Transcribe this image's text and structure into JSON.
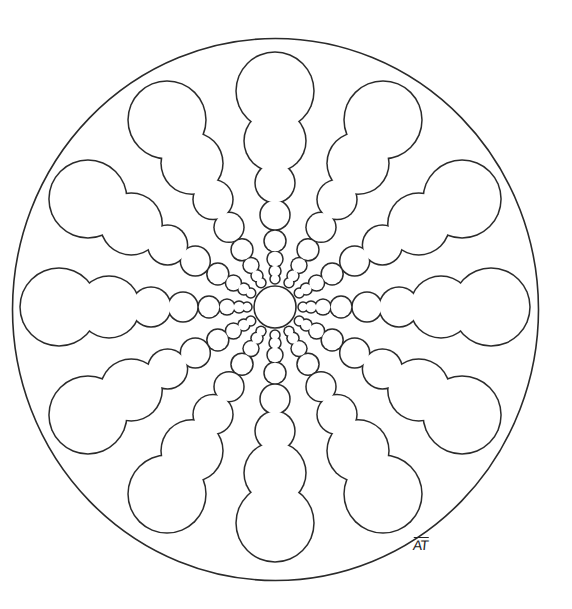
{
  "artwork": {
    "title": "Mandala coloring page",
    "stroke_color": "#2a2a2a",
    "background_color": "#ffffff",
    "fill_color": "#ffffff",
    "outer_ring": {
      "cx": 275.5,
      "cy": 309.5,
      "rx": 263,
      "ry": 271,
      "stroke_width": 1.6
    },
    "center_disc": {
      "cx": 275,
      "cy": 307,
      "r": 21,
      "stroke_width": 1.6
    },
    "petals": {
      "count": 12,
      "start_angle_deg": 0,
      "center": {
        "cx": 275,
        "cy": 307
      },
      "stroke_width": 1.5,
      "bead_chain": [
        {
          "distance": 216,
          "r": 39
        },
        {
          "distance": 166,
          "r": 31
        },
        {
          "distance": 124,
          "r": 20
        },
        {
          "distance": 92,
          "r": 15
        },
        {
          "distance": 66,
          "r": 11
        },
        {
          "distance": 48,
          "r": 8
        },
        {
          "distance": 36,
          "r": 6
        },
        {
          "distance": 28,
          "r": 5
        }
      ]
    },
    "signature": "AT"
  }
}
